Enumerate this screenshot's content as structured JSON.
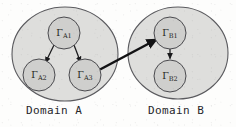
{
  "figure": {
    "type": "diagram",
    "background_color": "#fdfdfc",
    "ellipse_fill": "#dededc",
    "ellipse_stroke": "#5a5a5e",
    "node_fill": "#cfcfcd",
    "node_stroke": "#4a4a4e",
    "arrow_color": "#1a1a1c",
    "cross_arrow_color": "#121214"
  },
  "domains": [
    {
      "id": "domain-a",
      "caption": "Domain A",
      "ellipse": {
        "cx": 65,
        "cy": 54,
        "rx": 53,
        "ry": 47
      },
      "nodes": [
        {
          "id": "node-a1",
          "base": "Γ",
          "sub": "A1",
          "cx": 64,
          "cy": 33,
          "r": 16
        },
        {
          "id": "node-a2",
          "base": "Γ",
          "sub": "A2",
          "cx": 39,
          "cy": 75,
          "r": 16
        },
        {
          "id": "node-a3",
          "base": "Γ",
          "sub": "A3",
          "cx": 85,
          "cy": 75,
          "r": 16
        }
      ]
    },
    {
      "id": "domain-b",
      "caption": "Domain B",
      "ellipse": {
        "cx": 178,
        "cy": 53,
        "rx": 50,
        "ry": 46
      },
      "nodes": [
        {
          "id": "node-b1",
          "base": "Γ",
          "sub": "B1",
          "cx": 170,
          "cy": 33,
          "r": 16
        },
        {
          "id": "node-b2",
          "base": "Γ",
          "sub": "B2",
          "cx": 170,
          "cy": 76,
          "r": 16
        }
      ]
    }
  ],
  "edges": [
    {
      "id": "edge-a1-a2",
      "from": "node-a1",
      "to": "node-a2",
      "scope": "intra-domain-a",
      "style": "thin-arrow"
    },
    {
      "id": "edge-a1-a3",
      "from": "node-a1",
      "to": "node-a3",
      "scope": "intra-domain-a",
      "style": "thin-arrow"
    },
    {
      "id": "edge-b1-b2",
      "from": "node-b1",
      "to": "node-b2",
      "scope": "intra-domain-b",
      "style": "thin-arrow"
    },
    {
      "id": "edge-a3-b1",
      "from": "node-a3",
      "to": "node-b1",
      "scope": "cross-domain",
      "style": "thick-arrow"
    }
  ]
}
